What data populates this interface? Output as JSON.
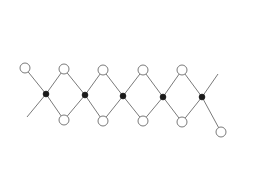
{
  "diagram": {
    "type": "chain-structure",
    "colors": {
      "bond": "#7a7a7a",
      "open_atom_fill": "#ffffff",
      "open_atom_stroke": "#7a7a7a",
      "solid_atom": "#1a1a1a"
    },
    "solid_nodes": [
      {
        "id": "S1",
        "x": 46,
        "y": 94
      },
      {
        "id": "S2",
        "x": 85,
        "y": 95
      },
      {
        "id": "S3",
        "x": 123,
        "y": 96
      },
      {
        "id": "S4",
        "x": 163,
        "y": 97
      },
      {
        "id": "S5",
        "x": 202,
        "y": 97
      }
    ],
    "open_nodes": [
      {
        "id": "O0",
        "x": 25,
        "y": 68
      },
      {
        "id": "T1",
        "x": 64,
        "y": 69
      },
      {
        "id": "B1",
        "x": 64,
        "y": 120
      },
      {
        "id": "T2",
        "x": 103,
        "y": 70
      },
      {
        "id": "B2",
        "x": 103,
        "y": 121
      },
      {
        "id": "T3",
        "x": 143,
        "y": 70
      },
      {
        "id": "B3",
        "x": 143,
        "y": 121
      },
      {
        "id": "T4",
        "x": 182,
        "y": 70
      },
      {
        "id": "B4",
        "x": 182,
        "y": 122
      },
      {
        "id": "O5",
        "x": 221,
        "y": 132
      }
    ],
    "tails": [
      {
        "from": "S1",
        "x2": 27,
        "y2": 117
      },
      {
        "from": "S5",
        "x2": 218,
        "y2": 74
      }
    ],
    "bonds": [
      [
        "O0",
        "S1"
      ],
      [
        "S1",
        "T1"
      ],
      [
        "S1",
        "B1"
      ],
      [
        "T1",
        "S2"
      ],
      [
        "B1",
        "S2"
      ],
      [
        "S2",
        "T2"
      ],
      [
        "S2",
        "B2"
      ],
      [
        "T2",
        "S3"
      ],
      [
        "B2",
        "S3"
      ],
      [
        "S3",
        "T3"
      ],
      [
        "S3",
        "B3"
      ],
      [
        "T3",
        "S4"
      ],
      [
        "B3",
        "S4"
      ],
      [
        "S4",
        "T4"
      ],
      [
        "S4",
        "B4"
      ],
      [
        "T4",
        "S5"
      ],
      [
        "B4",
        "S5"
      ],
      [
        "S5",
        "O5"
      ]
    ]
  }
}
